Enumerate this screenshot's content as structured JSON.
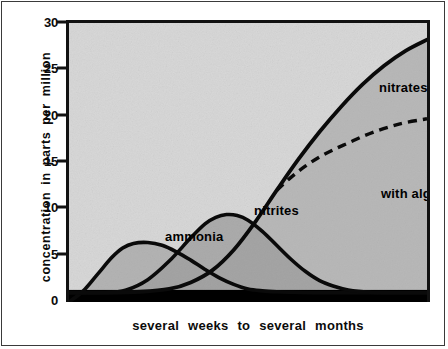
{
  "chart_data": {
    "type": "area",
    "title": "",
    "subtitle": "",
    "xlabel": "several weeks to several months",
    "ylabel": "concentration  in  parts  per  million",
    "ylim": [
      0,
      30
    ],
    "yticks": [
      0,
      5,
      10,
      15,
      20,
      25,
      30
    ],
    "ytick_labels": [
      "0",
      "5",
      "10",
      "15",
      "20",
      "25",
      "30"
    ],
    "xlim": [
      0,
      100
    ],
    "xticks": [],
    "xtick_labels": [],
    "grid": false,
    "legend": "inline-annotations",
    "baseline_band": {
      "label": "",
      "from": 0,
      "to": 1.3,
      "color": "#000000"
    },
    "plot_background": "#d4d4d4",
    "series": [
      {
        "name": "ammonia",
        "style": "solid",
        "color": "#111111",
        "x": [
          0,
          4,
          8,
          12,
          15,
          18,
          22,
          26,
          30,
          34,
          38,
          42,
          46,
          50,
          54,
          58,
          62,
          68,
          74,
          80,
          100
        ],
        "values": [
          0.0,
          1.2,
          3.0,
          4.8,
          5.8,
          6.3,
          6.4,
          6.1,
          5.4,
          4.5,
          3.5,
          2.6,
          1.9,
          1.4,
          1.2,
          1.1,
          1.05,
          1.0,
          1.0,
          1.0,
          1.0
        ]
      },
      {
        "name": "nitrites",
        "style": "solid",
        "color": "#111111",
        "x": [
          0,
          10,
          16,
          22,
          28,
          34,
          38,
          41,
          44,
          47,
          50,
          54,
          58,
          62,
          66,
          70,
          74,
          78,
          84,
          90,
          100
        ],
        "values": [
          1.0,
          1.0,
          1.3,
          2.4,
          4.4,
          6.9,
          8.4,
          9.1,
          9.4,
          9.3,
          8.8,
          7.6,
          6.1,
          4.6,
          3.3,
          2.3,
          1.7,
          1.3,
          1.05,
          1.0,
          1.0
        ]
      },
      {
        "name": "nitrates",
        "style": "solid",
        "color": "#111111",
        "x": [
          0,
          10,
          20,
          28,
          34,
          40,
          46,
          52,
          58,
          64,
          70,
          76,
          82,
          88,
          94,
          100
        ],
        "values": [
          1.0,
          1.0,
          1.1,
          1.4,
          2.1,
          3.4,
          5.6,
          8.6,
          12.0,
          15.3,
          18.3,
          21.0,
          23.4,
          25.4,
          27.0,
          28.2
        ]
      },
      {
        "name": "with algae growing",
        "style": "dashed",
        "color": "#111111",
        "x": [
          58,
          62,
          66,
          70,
          74,
          78,
          82,
          86,
          90,
          94,
          100
        ],
        "values": [
          12.0,
          13.4,
          14.6,
          15.6,
          16.4,
          17.1,
          17.8,
          18.4,
          18.9,
          19.3,
          19.7
        ]
      }
    ],
    "annotations": [
      {
        "text": "ammonia",
        "series": "ammonia"
      },
      {
        "text": "nitrites",
        "series": "nitrites"
      },
      {
        "text": "nitrates",
        "series": "nitrates"
      },
      {
        "text": "with algae growing",
        "series": "with algae growing"
      }
    ]
  },
  "labels": {
    "ammonia": "ammonia",
    "nitrites": "nitrites",
    "nitrates": "nitrates",
    "algae": "with algae growing"
  },
  "axes": {
    "y_title": "concentration  in  parts  per  million",
    "x_title": "several   weeks   to   several   months",
    "y_tick_0": "0",
    "y_tick_5": "5",
    "y_tick_10": "10",
    "y_tick_15": "15",
    "y_tick_20": "20",
    "y_tick_25": "25",
    "y_tick_30": "30"
  }
}
